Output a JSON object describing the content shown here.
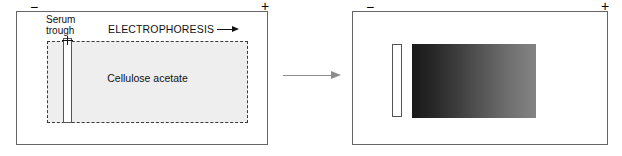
{
  "figure": {
    "panels": [
      {
        "id": "before",
        "name": "application",
        "electrode_negative": "−",
        "electrode_positive": "+",
        "support_label": "Cellulose acetate",
        "trough_label_line1": "Serum",
        "trough_label_line2": "trough",
        "direction_label": "ELECTROPHORESIS",
        "direction_arrow": "arrow-right-icon"
      },
      {
        "id": "after",
        "name": "separation-result",
        "electrode_negative": "−",
        "electrode_positive": "+",
        "band_description": "protein-band-gradient"
      }
    ],
    "transition": {
      "arrow": "arrow-right-icon"
    },
    "colors": {
      "support_fill": "#eeeeee",
      "support_border": "#3a3a3a",
      "panel_border": "#666666",
      "trough_fill": "#ffffff",
      "trough_border": "#555555",
      "band_dark": "#1a1a1a",
      "band_light": "#838383",
      "transition_arrow": "#8c8c8c",
      "ink": "#111111"
    }
  }
}
